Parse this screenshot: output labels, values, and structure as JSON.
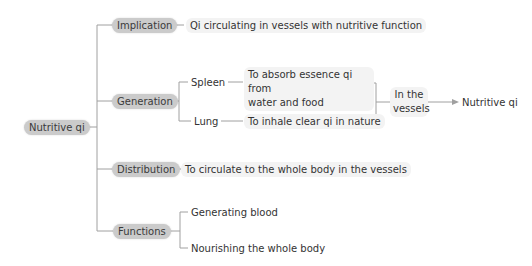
{
  "root": {
    "label": "Nutritive qi"
  },
  "branches": {
    "implication": {
      "label": "Implication",
      "detail": "Qi circulating in vessels with nutritive function"
    },
    "generation": {
      "label": "Generation",
      "spleen": {
        "label": "Spleen",
        "detail_line1": "To absorb essence qi from",
        "detail_line2": "water and food"
      },
      "lung": {
        "label": "Lung",
        "detail": "To inhale clear qi in nature"
      },
      "merge": {
        "line1": "In the",
        "line2": "vessels"
      },
      "result": "Nutritive qi"
    },
    "distribution": {
      "label": "Distribution",
      "detail": "To circulate to the whole body in the vessels"
    },
    "functions": {
      "label": "Functions",
      "items": [
        "Generating blood",
        "Nourishing the whole body"
      ]
    }
  },
  "colors": {
    "category_bg": "#cbcbcb",
    "leaf_bg": "#f3f3f3",
    "line": "#9a9a9a",
    "text": "#333333"
  }
}
